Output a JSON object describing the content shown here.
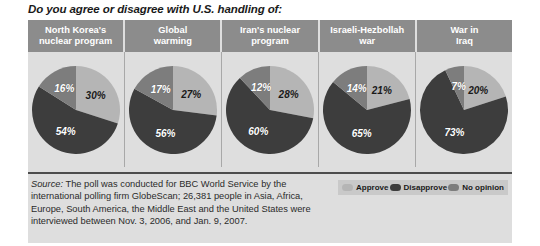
{
  "title": "Do you agree or disagree with U.S. handling of:",
  "colors": {
    "approve": "#b5b5b5",
    "disapprove": "#3d3d3d",
    "no_opinion": "#7d7d7d",
    "header_bg": "#8c8c8c",
    "panel_bg": "#dedede",
    "legend_bg": "#c9c9c9"
  },
  "headers": [
    {
      "line1": "North Korea's",
      "line2": "nuclear program"
    },
    {
      "line1": "Global",
      "line2": "warming"
    },
    {
      "line1": "Iran's nuclear",
      "line2": "program"
    },
    {
      "line1": "Israeli-Hezbollah",
      "line2": "war"
    },
    {
      "line1": "War in",
      "line2": "Iraq"
    }
  ],
  "legend": [
    {
      "label": "Approve",
      "color": "#b5b5b5"
    },
    {
      "label": "Disapprove",
      "color": "#3d3d3d"
    },
    {
      "label": "No opinion",
      "color": "#7d7d7d"
    }
  ],
  "source": {
    "label": "Source:",
    "text": " The poll was conducted for BBC World Service by the international polling firm GlobeScan; 26,381 people in Asia, Africa, Europe, South America, the Middle East and the United States were interviewed between Nov. 3, 2006, and Jan. 9, 2007."
  },
  "pies": [
    {
      "name": "north-korea-nuclear-program",
      "labels": {
        "approve": "30%",
        "disapprove": "54%",
        "no_opinion": "16%"
      }
    },
    {
      "name": "global-warming",
      "labels": {
        "approve": "27%",
        "disapprove": "56%",
        "no_opinion": "17%"
      }
    },
    {
      "name": "iran-nuclear-program",
      "labels": {
        "approve": "28%",
        "disapprove": "60%",
        "no_opinion": "12%"
      }
    },
    {
      "name": "israeli-hezbollah-war",
      "labels": {
        "approve": "21%",
        "disapprove": "65%",
        "no_opinion": "14%"
      }
    },
    {
      "name": "war-in-iraq",
      "labels": {
        "approve": "20%",
        "disapprove": "73%",
        "no_opinion": "7%"
      }
    }
  ],
  "chart_data": {
    "type": "pie",
    "title": "Do you agree or disagree with U.S. handling of:",
    "legend_position": "bottom-right",
    "series_names": [
      "Approve",
      "Disapprove",
      "No opinion"
    ],
    "series_colors": [
      "#b5b5b5",
      "#3d3d3d",
      "#7d7d7d"
    ],
    "categories": [
      "North Korea's nuclear program",
      "Global warming",
      "Iran's nuclear program",
      "Israeli-Hezbollah war",
      "War in Iraq"
    ],
    "charts": [
      {
        "category": "North Korea's nuclear program",
        "slices": [
          30,
          54,
          16
        ],
        "labels": [
          "30%",
          "54%",
          "16%"
        ]
      },
      {
        "category": "Global warming",
        "slices": [
          27,
          56,
          17
        ],
        "labels": [
          "27%",
          "56%",
          "17%"
        ]
      },
      {
        "category": "Iran's nuclear program",
        "slices": [
          28,
          60,
          12
        ],
        "labels": [
          "28%",
          "60%",
          "12%"
        ]
      },
      {
        "category": "Israeli-Hezbollah war",
        "slices": [
          21,
          65,
          14
        ],
        "labels": [
          "21%",
          "65%",
          "14%"
        ]
      },
      {
        "category": "War in Iraq",
        "slices": [
          20,
          73,
          7
        ],
        "labels": [
          "20%",
          "73%",
          "7%"
        ]
      }
    ],
    "units": "percent",
    "source": "The poll was conducted for BBC World Service by the international polling firm GlobeScan; 26,381 people in Asia, Africa, Europe, South America, the Middle East and the United States were interviewed between Nov. 3, 2006, and Jan. 9, 2007."
  }
}
